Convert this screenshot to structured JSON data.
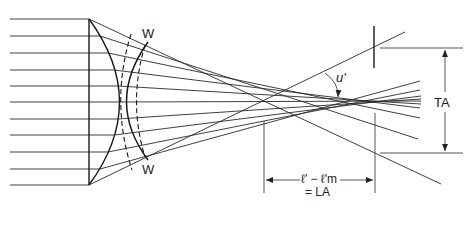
{
  "diagram": {
    "labels": {
      "wavefront_top": "W",
      "wavefront_bottom": "W",
      "angle": "u'",
      "transverse_aberration": "TA",
      "longitudinal_formula": "ℓ' − ℓ'm",
      "longitudinal_result": "= LA"
    },
    "incident_rays_y": [
      19,
      36,
      53,
      70,
      86,
      102,
      119,
      135,
      152,
      169,
      185
    ],
    "colors": {
      "line": "#2a2a2a",
      "background": "#ffffff"
    }
  }
}
